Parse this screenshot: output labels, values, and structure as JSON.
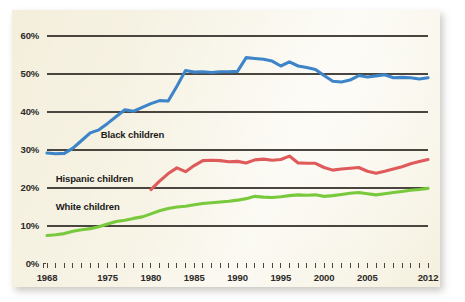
{
  "figure": {
    "background_color": "#ffffff",
    "panel_color": "#f4efdc",
    "gridline_color": "#4a463f",
    "text_color": "#2c2a28"
  },
  "chart_data": {
    "type": "line",
    "title": "",
    "subtitle": "",
    "xlabel": "",
    "ylabel": "",
    "xlim": [
      1968,
      2012
    ],
    "ylim": [
      0,
      60
    ],
    "grid": true,
    "grid_axis": "y",
    "legend_position": "inline-annotations",
    "ytick_labels": [
      "0%",
      "10%",
      "20%",
      "30%",
      "40%",
      "50%",
      "60%"
    ],
    "ytick_values": [
      0,
      10,
      20,
      30,
      40,
      50,
      60
    ],
    "xtick_labels": [
      "1968",
      "1975",
      "1980",
      "1985",
      "1990",
      "1995",
      "2000",
      "2005",
      "2012"
    ],
    "xtick_values": [
      1968,
      1975,
      1980,
      1985,
      1990,
      1995,
      2000,
      2005,
      2012
    ],
    "minor_xticks_every": 1,
    "annotations": [
      {
        "text": "Black children",
        "x": 1974.2,
        "y": 34.0,
        "color": "#1b1a18"
      },
      {
        "text": "Hispanic children",
        "x": 1969.0,
        "y": 22.3,
        "color": "#1b1a18"
      },
      {
        "text": "White children",
        "x": 1969.0,
        "y": 15.0,
        "color": "#1b1a18"
      }
    ],
    "series": [
      {
        "name": "Black children",
        "label": "Black children",
        "color": "#3d85c8",
        "x": [
          1968,
          1969,
          1970,
          1971,
          1972,
          1973,
          1974,
          1975,
          1976,
          1977,
          1978,
          1979,
          1980,
          1981,
          1982,
          1983,
          1984,
          1985,
          1986,
          1987,
          1988,
          1989,
          1990,
          1991,
          1992,
          1993,
          1994,
          1995,
          1996,
          1997,
          1998,
          1999,
          2000,
          2001,
          2002,
          2003,
          2004,
          2005,
          2006,
          2007,
          2008,
          2009,
          2010,
          2011,
          2012
        ],
        "values": [
          29.2,
          29.0,
          29.1,
          30.5,
          32.5,
          34.5,
          35.3,
          37.0,
          38.8,
          40.6,
          40.2,
          41.2,
          42.2,
          43.0,
          42.9,
          46.8,
          50.9,
          50.5,
          50.6,
          50.4,
          50.6,
          50.6,
          50.7,
          54.3,
          54.1,
          53.9,
          53.4,
          52.1,
          53.2,
          52.1,
          51.7,
          51.2,
          49.6,
          48.1,
          47.9,
          48.4,
          49.6,
          49.2,
          49.5,
          49.8,
          49.0,
          49.1,
          49.0,
          48.7,
          49.0
        ]
      },
      {
        "name": "Hispanic children",
        "label": "Hispanic children",
        "color": "#df5b5b",
        "x": [
          1980,
          1981,
          1982,
          1983,
          1984,
          1985,
          1986,
          1987,
          1988,
          1989,
          1990,
          1991,
          1992,
          1993,
          1994,
          1995,
          1996,
          1997,
          1998,
          1999,
          2000,
          2001,
          2002,
          2003,
          2004,
          2005,
          2006,
          2007,
          2008,
          2009,
          2010,
          2011,
          2012
        ],
        "values": [
          19.6,
          21.8,
          23.8,
          25.3,
          24.3,
          25.9,
          27.2,
          27.3,
          27.2,
          26.9,
          27.0,
          26.6,
          27.4,
          27.6,
          27.3,
          27.5,
          28.4,
          26.6,
          26.5,
          26.5,
          25.4,
          24.7,
          25.0,
          25.2,
          25.4,
          24.4,
          23.9,
          24.4,
          25.0,
          25.6,
          26.4,
          27.0,
          27.5
        ]
      },
      {
        "name": "White children",
        "label": "White children",
        "color": "#79c93d",
        "x": [
          1968,
          1969,
          1970,
          1971,
          1972,
          1973,
          1974,
          1975,
          1976,
          1977,
          1978,
          1979,
          1980,
          1981,
          1982,
          1983,
          1984,
          1985,
          1986,
          1987,
          1988,
          1989,
          1990,
          1991,
          1992,
          1993,
          1994,
          1995,
          1996,
          1997,
          1998,
          1999,
          2000,
          2001,
          2002,
          2003,
          2004,
          2005,
          2006,
          2007,
          2008,
          2009,
          2010,
          2011,
          2012
        ],
        "values": [
          7.5,
          7.7,
          8.0,
          8.6,
          9.0,
          9.3,
          9.8,
          10.5,
          11.2,
          11.5,
          12.0,
          12.4,
          13.2,
          14.0,
          14.6,
          15.0,
          15.2,
          15.6,
          15.9,
          16.1,
          16.3,
          16.5,
          16.8,
          17.2,
          17.8,
          17.6,
          17.5,
          17.7,
          18.0,
          18.2,
          18.1,
          18.2,
          17.8,
          18.0,
          18.3,
          18.6,
          18.8,
          18.5,
          18.2,
          18.5,
          18.8,
          19.1,
          19.4,
          19.6,
          19.9
        ]
      }
    ]
  }
}
